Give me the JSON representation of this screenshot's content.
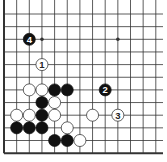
{
  "diagram": {
    "type": "go-board-fragment",
    "grid": {
      "columns": 13,
      "rows": 12,
      "origin_x": 4,
      "origin_y": 14,
      "spacing": 12.65,
      "right_extent": 163,
      "top_extent": 0,
      "edges": {
        "left": true,
        "bottom": true,
        "top": false,
        "right": false
      }
    },
    "colors": {
      "background": "#ffffff",
      "line": "#333333",
      "black_stone": "#111111",
      "white_stone": "#ffffff",
      "white_stone_border": "#222222"
    },
    "hoshi": [
      {
        "c": 3,
        "r": 2
      },
      {
        "c": 9,
        "r": 2
      }
    ],
    "stones": [
      {
        "color": "black",
        "c": 2,
        "r": 2,
        "label": "4"
      },
      {
        "color": "white",
        "c": 3,
        "r": 4,
        "label": "1"
      },
      {
        "color": "black",
        "c": 8,
        "r": 6,
        "label": "2"
      },
      {
        "color": "white",
        "c": 9,
        "r": 8,
        "label": "3"
      },
      {
        "color": "white",
        "c": 2,
        "r": 6,
        "label": ""
      },
      {
        "color": "white",
        "c": 3,
        "r": 6,
        "label": ""
      },
      {
        "color": "black",
        "c": 4,
        "r": 6,
        "label": ""
      },
      {
        "color": "black",
        "c": 5,
        "r": 6,
        "label": ""
      },
      {
        "color": "black",
        "c": 3,
        "r": 7,
        "label": ""
      },
      {
        "color": "white",
        "c": 4,
        "r": 7,
        "label": ""
      },
      {
        "color": "white",
        "c": 1,
        "r": 8,
        "label": ""
      },
      {
        "color": "white",
        "c": 2,
        "r": 8,
        "label": ""
      },
      {
        "color": "black",
        "c": 3,
        "r": 8,
        "label": ""
      },
      {
        "color": "white",
        "c": 4,
        "r": 8,
        "label": ""
      },
      {
        "color": "white",
        "c": 7,
        "r": 8,
        "label": ""
      },
      {
        "color": "black",
        "c": 1,
        "r": 9,
        "label": ""
      },
      {
        "color": "black",
        "c": 2,
        "r": 9,
        "label": ""
      },
      {
        "color": "black",
        "c": 3,
        "r": 9,
        "label": ""
      },
      {
        "color": "white",
        "c": 5,
        "r": 9,
        "label": ""
      },
      {
        "color": "black",
        "c": 4,
        "r": 10,
        "label": ""
      },
      {
        "color": "black",
        "c": 5,
        "r": 10,
        "label": ""
      },
      {
        "color": "white",
        "c": 6,
        "r": 10,
        "label": ""
      }
    ]
  }
}
